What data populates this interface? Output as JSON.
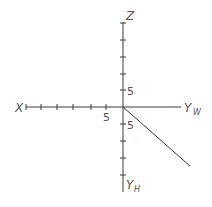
{
  "diagram": {
    "type": "three-view projection axes",
    "origin": {
      "x": 123,
      "y": 107
    },
    "tick_spacing": 16.8,
    "axes": {
      "z": {
        "label": "Z",
        "ticks_up": 5
      },
      "x": {
        "label": "X",
        "ticks_left": 6
      },
      "yw": {
        "label": "Y",
        "subscript": "W"
      },
      "yh": {
        "label": "Y",
        "subscript": "H",
        "ticks_down": 4
      }
    },
    "tick_labels": {
      "z_axis": "5",
      "x_axis": "5",
      "yh_axis": "5"
    },
    "colors": {
      "line": "#3a3a3a",
      "text": "#555555"
    }
  }
}
